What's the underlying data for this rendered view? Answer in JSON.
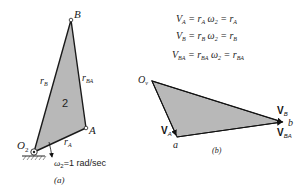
{
  "figure_a": {
    "caption": "(a)",
    "link_label": "2",
    "points": {
      "O2": "O",
      "O2_sub": "2",
      "A": "A",
      "B": "B"
    },
    "vectors": {
      "rA": "r",
      "rA_sub": "A",
      "rB": "r",
      "rB_sub": "B",
      "rBA": "r",
      "rBA_sub": "BA"
    },
    "omega": {
      "symbol": "ω",
      "sub": "2",
      "value": "=1 rad/sec"
    }
  },
  "equations": [
    {
      "lhs": "V",
      "lhs_sub": "A",
      "mid": "= r",
      "mid_sub": "A",
      "omega": " ω",
      "omega_sub": "2",
      "rhs": " = r",
      "rhs_sub": "A"
    },
    {
      "lhs": "V",
      "lhs_sub": "B",
      "mid": "= r",
      "mid_sub": "B",
      "omega": " ω",
      "omega_sub": "2",
      "rhs": " = r",
      "rhs_sub": "B"
    },
    {
      "lhs": "V",
      "lhs_sub": "BA",
      "mid": "= r",
      "mid_sub": "BA",
      "omega": " ω",
      "omega_sub": "2",
      "rhs": " = r",
      "rhs_sub": "BA"
    }
  ],
  "figure_b": {
    "caption": "(b)",
    "origin": "O",
    "origin_sub": "v",
    "point_a": "a",
    "point_b": "b",
    "VA": "V",
    "VA_sub": "A",
    "VB": "V",
    "VB_sub": "B",
    "VBA": "V",
    "VBA_sub": "BA"
  },
  "colors": {
    "fill": "#b8b8b8",
    "stroke": "#1a1a1a"
  }
}
